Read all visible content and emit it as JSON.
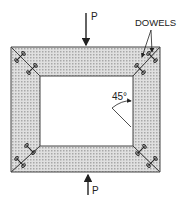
{
  "diagram": {
    "load_top_label": "P",
    "load_bottom_label": "P",
    "dowels_label": "DOWELS",
    "angle_label": "45°",
    "colors": {
      "line": "#222222",
      "fill_shade": "#c8c8c8",
      "background": "#ffffff"
    }
  }
}
